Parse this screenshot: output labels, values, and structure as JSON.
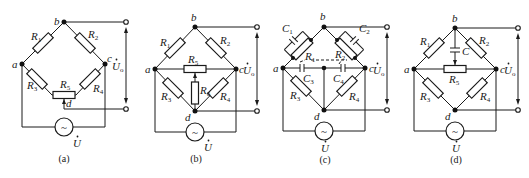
{
  "figure": {
    "panels": [
      {
        "id": "a",
        "caption": "(a)",
        "nodes": {
          "a": "a",
          "b": "b",
          "c": "c",
          "d": "d"
        },
        "resistors": [
          "R1",
          "R2",
          "R3",
          "R4",
          "R5"
        ],
        "labels": {
          "R1": "R",
          "R1s": "1",
          "R2": "R",
          "R2s": "2",
          "R3": "R",
          "R3s": "3",
          "R4": "R",
          "R4s": "4",
          "R5": "R",
          "R5s": "5"
        },
        "source_label": "U",
        "output_label": "U",
        "output_sub": "o"
      },
      {
        "id": "b",
        "caption": "(b)",
        "nodes": {
          "a": "a",
          "b": "b",
          "c": "c",
          "d": "d"
        },
        "labels": {
          "R1": "R",
          "R1s": "1",
          "R2": "R",
          "R2s": "2",
          "R3": "R",
          "R3s": "3",
          "R4": "R",
          "R4s": "4",
          "R5": "R",
          "R5s": "5",
          "R6": "R",
          "R6s": "6"
        },
        "source_label": "U",
        "output_label": "U",
        "output_sub": "o"
      },
      {
        "id": "c",
        "caption": "(c)",
        "nodes": {
          "a": "a",
          "b": "b",
          "c": "c",
          "d": "d"
        },
        "labels": {
          "C1": "C",
          "C1s": "1",
          "C2": "C",
          "C2s": "2",
          "C3": "C",
          "C3s": "3",
          "C4": "C",
          "C4s": "4",
          "R1": "R",
          "R1s": "1",
          "R2": "R",
          "R2s": "2",
          "R3": "R",
          "R3s": "3",
          "R4": "R",
          "R4s": "4"
        },
        "source_label": "U",
        "output_label": "U",
        "output_sub": "o"
      },
      {
        "id": "d",
        "caption": "(d)",
        "nodes": {
          "a": "a",
          "b": "b",
          "c": "c",
          "d": "d"
        },
        "labels": {
          "R1": "R",
          "R1s": "1",
          "R2": "R",
          "R2s": "2",
          "R3": "R",
          "R3s": "3",
          "R4": "R",
          "R4s": "4",
          "R5": "R",
          "R5s": "5",
          "C": "C"
        },
        "source_label": "U",
        "output_label": "U",
        "output_sub": "o"
      }
    ],
    "source_symbol": "~",
    "colors": {
      "line": "#1a1a1a",
      "background": "#ffffff"
    }
  }
}
